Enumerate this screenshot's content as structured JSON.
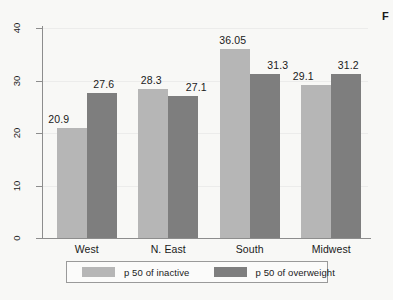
{
  "chart_data": {
    "type": "bar",
    "title": "",
    "subtitle": "",
    "xlabel": "",
    "ylabel": "",
    "categories": [
      "West",
      "N. East",
      "South",
      "Midwest"
    ],
    "series": [
      {
        "name": "p 50 of inactive",
        "color": "#b6b6b6",
        "values": [
          20.9,
          28.3,
          36.05,
          29.1
        ],
        "labels": [
          "20.9",
          "28.3",
          "36.05",
          "29.1"
        ]
      },
      {
        "name": "p 50 of overweight",
        "color": "#7e7e7e",
        "values": [
          27.6,
          27.1,
          31.3,
          31.2
        ],
        "labels": [
          "27.6",
          "27.1",
          "31.3",
          "31.2"
        ]
      }
    ],
    "ylim": [
      0,
      40
    ],
    "yticks": [
      0,
      10,
      20,
      30,
      40
    ],
    "ytick_labels": [
      "0",
      "10",
      "20",
      "30",
      "40"
    ],
    "ytick_rotation": -90,
    "grid": true,
    "grid_color": "#ececeb",
    "legend_position": "bottom",
    "axis_color": "#8d8d8d",
    "background": "#f8f8f6"
  },
  "legend": {
    "entries": [
      {
        "label": "p 50 of inactive",
        "color": "#b6b6b6"
      },
      {
        "label": "p 50 of overweight",
        "color": "#7e7e7e"
      }
    ]
  },
  "edge_caption": "F"
}
